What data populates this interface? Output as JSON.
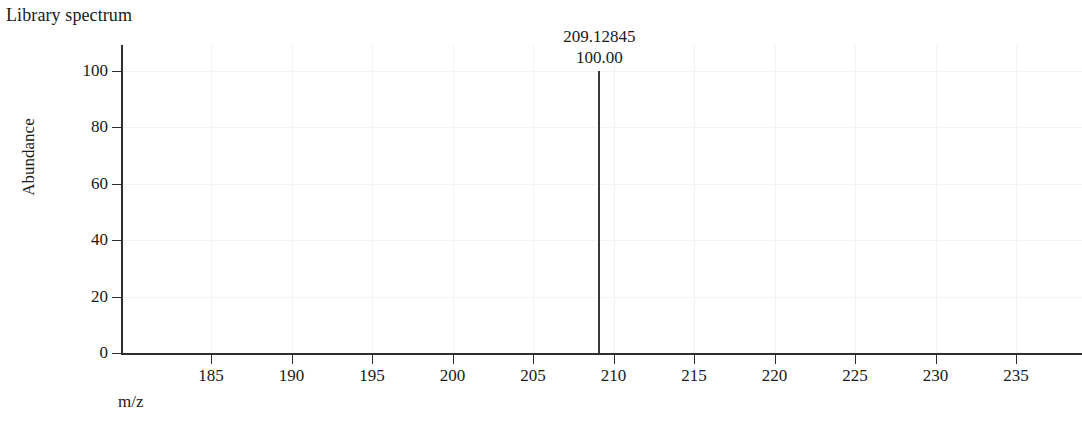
{
  "figure": {
    "title": "Library spectrum"
  },
  "chart_data": {
    "type": "bar",
    "title": "Library spectrum",
    "xlabel": "m/z",
    "ylabel": "Abundance",
    "xlim": [
      181.2,
      240.8
    ],
    "ylim": [
      0,
      107
    ],
    "grid": true,
    "legend": null,
    "x_ticks": [
      185,
      190,
      195,
      200,
      205,
      210,
      215,
      220,
      225,
      230,
      235
    ],
    "x_tick_labels": [
      "185",
      "190",
      "195",
      "200",
      "205",
      "210",
      "215",
      "220",
      "225",
      "230",
      "235"
    ],
    "y_ticks": [
      0,
      20,
      40,
      60,
      80,
      100
    ],
    "y_tick_labels": [
      "0",
      "20",
      "40",
      "60",
      "80",
      "100"
    ],
    "x": [
      209.12845
    ],
    "values": [
      100.0
    ],
    "peaks": [
      {
        "mz": 209.12845,
        "abundance": 100.0,
        "mz_label": "209.12845",
        "abundance_label": "100.00"
      }
    ]
  },
  "colors": {
    "peak": "#3a3a3a",
    "axis": "#2e2e2e",
    "grid": "#f2f3f5",
    "text": "#1a1a1a",
    "background": "#ffffff"
  }
}
